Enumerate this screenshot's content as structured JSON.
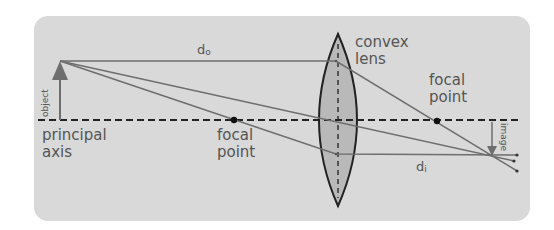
{
  "diagram": {
    "labels": {
      "object": "object",
      "image": "image",
      "principal_axis_line1": "principal",
      "principal_axis_line2": "axis",
      "left_focal_line1": "focal",
      "left_focal_line2": "point",
      "right_focal_line1": "focal",
      "right_focal_line2": "point",
      "lens_line1": "convex",
      "lens_line2": "lens",
      "object_distance_base": "d",
      "object_distance_sub": "o",
      "image_distance_base": "d",
      "image_distance_sub": "i"
    },
    "colors": {
      "panel": "#d9d9d9",
      "ray": "#6e6e6e",
      "axis": "#222222",
      "lens_fill": "#b9b9b9",
      "lens_stroke": "#222222",
      "object_arrow": "#6e6e6e",
      "text": "#555555"
    }
  }
}
